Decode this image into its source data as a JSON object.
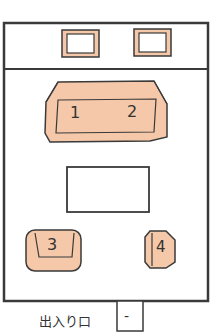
{
  "diagram": {
    "type": "room_floor_plan",
    "colors": {
      "furniture_fill": "#f4c8a8",
      "line": "#3a3a3a",
      "background": "#ffffff"
    },
    "windows": [
      {
        "id": "window-1"
      },
      {
        "id": "window-2"
      }
    ],
    "sofa": {
      "seats": [
        "1",
        "2"
      ]
    },
    "table": {
      "label": ""
    },
    "armchair": {
      "seat": "3"
    },
    "stool": {
      "seat": "4"
    },
    "entrance": {
      "label": "出入り口",
      "door_mark": "-"
    }
  }
}
